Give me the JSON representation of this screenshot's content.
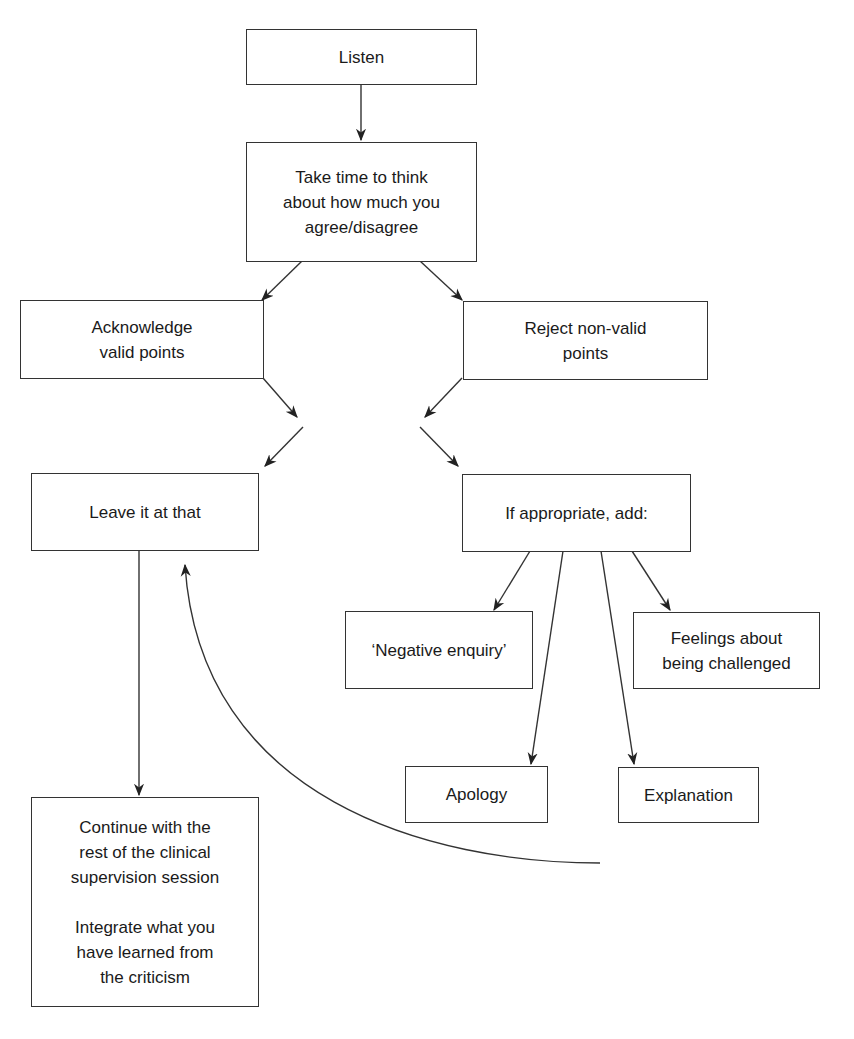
{
  "diagram": {
    "type": "flowchart",
    "colors": {
      "stroke": "#333333",
      "background": "#ffffff",
      "text": "#1a1a1a"
    },
    "nodes": [
      {
        "id": "listen",
        "lines": [
          "Listen"
        ]
      },
      {
        "id": "think",
        "lines": [
          "Take time to think",
          "about how much you",
          "agree/disagree"
        ]
      },
      {
        "id": "acknowledge",
        "lines": [
          "Acknowledge",
          "valid points"
        ]
      },
      {
        "id": "reject",
        "lines": [
          "Reject non-valid",
          "points"
        ]
      },
      {
        "id": "leave",
        "lines": [
          "Leave it at that"
        ]
      },
      {
        "id": "if_appropriate",
        "lines": [
          "If appropriate, add:"
        ]
      },
      {
        "id": "negative_enquiry",
        "lines": [
          "‘Negative enquiry’"
        ]
      },
      {
        "id": "feelings",
        "lines": [
          "Feelings about",
          "being challenged"
        ]
      },
      {
        "id": "apology",
        "lines": [
          "Apology"
        ]
      },
      {
        "id": "explanation",
        "lines": [
          "Explanation"
        ]
      },
      {
        "id": "continue",
        "paragraphs": [
          [
            "Continue with the",
            "rest of the clinical",
            "supervision session"
          ],
          [
            "Integrate what you",
            "have learned from",
            "the criticism"
          ]
        ]
      }
    ],
    "edges": [
      {
        "from": "listen",
        "to": "think"
      },
      {
        "from": "think",
        "to": "acknowledge"
      },
      {
        "from": "think",
        "to": "reject"
      },
      {
        "from": "acknowledge",
        "to": "leave",
        "note": "crossing arrows toward center"
      },
      {
        "from": "acknowledge",
        "to": "if_appropriate"
      },
      {
        "from": "reject",
        "to": "leave"
      },
      {
        "from": "reject",
        "to": "if_appropriate"
      },
      {
        "from": "if_appropriate",
        "to": "negative_enquiry"
      },
      {
        "from": "if_appropriate",
        "to": "apology"
      },
      {
        "from": "if_appropriate",
        "to": "explanation"
      },
      {
        "from": "if_appropriate",
        "to": "feelings"
      },
      {
        "from": "leave",
        "to": "continue"
      },
      {
        "from": "additions",
        "to": "leave",
        "style": "curved-return"
      }
    ]
  }
}
